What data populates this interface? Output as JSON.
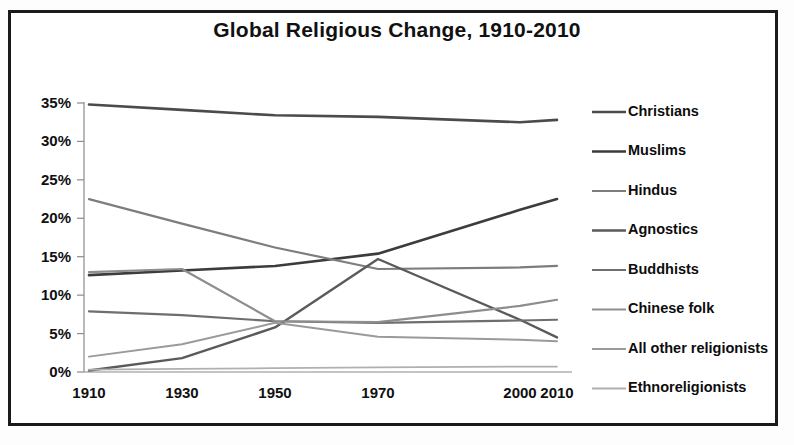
{
  "chart_data": {
    "type": "line",
    "title": "Global Religious Change, 1910-2010",
    "xlabel": "",
    "ylabel": "",
    "grid": false,
    "legend_position": "right",
    "x": [
      1910,
      1930,
      1950,
      1970,
      2000,
      2010
    ],
    "xtick_labels": [
      "1910",
      "1930",
      "1950",
      "1970",
      "2000",
      "2010"
    ],
    "ylim": [
      0,
      35
    ],
    "ytick_labels": [
      "0%",
      "5%",
      "10%",
      "15%",
      "20%",
      "25%",
      "30%",
      "35%"
    ],
    "ytick_values": [
      0,
      5,
      10,
      15,
      20,
      25,
      30,
      35
    ],
    "series": [
      {
        "name": "Christians",
        "color": "#4b4b4b",
        "width": 2.6,
        "values": [
          34.8,
          34.1,
          33.4,
          33.2,
          32.5,
          32.8
        ]
      },
      {
        "name": "Muslims",
        "color": "#3c3c3c",
        "width": 2.6,
        "values": [
          12.6,
          13.2,
          13.8,
          15.4,
          21.1,
          22.5
        ]
      },
      {
        "name": "Hindus",
        "color": "#7d7d7d",
        "width": 2.2,
        "values": [
          22.5,
          19.3,
          16.2,
          13.4,
          13.6,
          13.8
        ]
      },
      {
        "name": "Agnostics",
        "color": "#5a5a5a",
        "width": 2.4,
        "values": [
          0.2,
          1.8,
          5.8,
          14.7,
          6.8,
          4.5
        ]
      },
      {
        "name": "Buddhists",
        "color": "#6e6e6e",
        "width": 2.2,
        "values": [
          7.9,
          7.4,
          6.6,
          6.4,
          6.7,
          6.8
        ]
      },
      {
        "name": "Chinese folk",
        "color": "#8d8d8d",
        "width": 2.2,
        "values": [
          13.0,
          13.4,
          6.6,
          6.5,
          8.6,
          9.4
        ]
      },
      {
        "name": "All other religionists",
        "color": "#9a9a9a",
        "width": 2.0,
        "values": [
          2.0,
          3.6,
          6.4,
          4.6,
          4.2,
          4.0
        ]
      },
      {
        "name": "Ethnoreligionists",
        "color": "#b0b0b0",
        "width": 1.8,
        "values": [
          0.3,
          0.4,
          0.5,
          0.6,
          0.7,
          0.7
        ]
      }
    ]
  },
  "legend": {
    "items": [
      {
        "label": "Christians"
      },
      {
        "label": "Muslims"
      },
      {
        "label": "Hindus"
      },
      {
        "label": "Agnostics"
      },
      {
        "label": "Buddhists"
      },
      {
        "label": "Chinese folk"
      },
      {
        "label": "All other religionists"
      },
      {
        "label": "Ethnoreligionists"
      }
    ]
  }
}
